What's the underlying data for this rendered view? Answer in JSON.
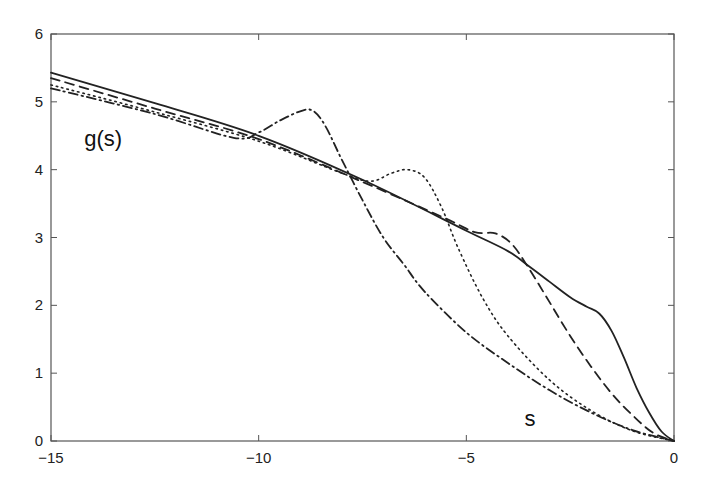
{
  "chart_data": {
    "type": "line",
    "title": "",
    "xlabel": "s",
    "ylabel": "g(s)",
    "xlim": [
      -15,
      0
    ],
    "ylim": [
      0,
      6
    ],
    "grid": false,
    "legend": null,
    "xticks": [
      -15,
      -10,
      -5,
      0
    ],
    "xtick_labels": [
      "−15",
      "−10",
      "−5",
      "0"
    ],
    "yticks": [
      0,
      1,
      2,
      3,
      4,
      5,
      6
    ],
    "ytick_labels": [
      "0",
      "1",
      "2",
      "3",
      "4",
      "5",
      "6"
    ],
    "annotations": [
      {
        "text": "g(s)",
        "x": -14.2,
        "y": 4.35
      },
      {
        "text": "s",
        "x": -3.6,
        "y": 0.22
      }
    ],
    "series": [
      {
        "name": "solid",
        "style": "solid",
        "x": [
          -15,
          -12.5,
          -10,
          -7.5,
          -5,
          -4,
          -3.5,
          -3,
          -2.5,
          -2.1,
          -1.8,
          -1.5,
          -1.2,
          -0.9,
          -0.6,
          -0.3,
          0
        ],
        "y": [
          5.43,
          4.98,
          4.5,
          3.85,
          3.1,
          2.8,
          2.58,
          2.35,
          2.12,
          1.98,
          1.88,
          1.62,
          1.22,
          0.78,
          0.42,
          0.14,
          0
        ]
      },
      {
        "name": "dashed",
        "style": "dashed",
        "x": [
          -15,
          -12.5,
          -10,
          -7.5,
          -5.5,
          -4.8,
          -4.3,
          -3.9,
          -3.5,
          -3,
          -2.5,
          -2,
          -1.5,
          -1,
          -0.5,
          0
        ],
        "y": [
          5.35,
          4.9,
          4.45,
          3.82,
          3.28,
          3.08,
          3.06,
          2.9,
          2.55,
          2.05,
          1.55,
          1.1,
          0.7,
          0.38,
          0.12,
          0
        ]
      },
      {
        "name": "dotted",
        "style": "dotted",
        "x": [
          -15,
          -12.5,
          -10,
          -8,
          -7.3,
          -6.8,
          -6.4,
          -6,
          -5.6,
          -5.2,
          -4.6,
          -4,
          -3,
          -2,
          -1,
          0
        ],
        "y": [
          5.25,
          4.85,
          4.42,
          3.95,
          3.83,
          3.95,
          4.0,
          3.88,
          3.45,
          2.85,
          2.1,
          1.55,
          0.9,
          0.45,
          0.15,
          0
        ]
      },
      {
        "name": "dash-dot",
        "style": "dashdot",
        "x": [
          -15,
          -12.5,
          -10.6,
          -10,
          -9.5,
          -9,
          -8.7,
          -8.4,
          -8,
          -7.5,
          -7,
          -6.5,
          -6,
          -5,
          -4,
          -3,
          -2,
          -1,
          0
        ],
        "y": [
          5.2,
          4.82,
          4.47,
          4.55,
          4.72,
          4.86,
          4.87,
          4.65,
          4.15,
          3.55,
          3.0,
          2.6,
          2.2,
          1.6,
          1.15,
          0.75,
          0.42,
          0.16,
          0
        ]
      }
    ]
  }
}
